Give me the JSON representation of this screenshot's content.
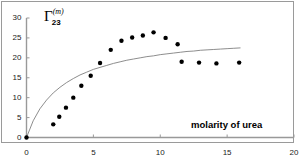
{
  "chart_data": {
    "type": "scatter",
    "title": "",
    "xlabel": "molarity of urea",
    "ylabel": "Γ·(m) 23",
    "ylabel_parts": {
      "symbol": "Γ",
      "superscript": "(m)",
      "subscript": "23"
    },
    "xlim": [
      0,
      20
    ],
    "ylim": [
      0,
      30
    ],
    "xticks": [
      0,
      5,
      10,
      15,
      20
    ],
    "yticks": [
      0,
      5,
      10,
      15,
      20,
      25,
      30
    ],
    "xtick_labels": [
      "0",
      "5",
      "10",
      "15",
      "20"
    ],
    "ytick_labels": [
      "0",
      "5",
      "10",
      "15",
      "20",
      "25",
      "30"
    ],
    "grid": false,
    "legend": null,
    "frame": true,
    "marker_color": "#000000",
    "curve_color": "#808080",
    "axis_color": "#999999",
    "series": [
      {
        "name": "data points",
        "style": "markers",
        "points": [
          [
            0.0,
            0.0
          ],
          [
            2.0,
            3.3
          ],
          [
            2.45,
            5.2
          ],
          [
            2.95,
            7.5
          ],
          [
            3.5,
            10.0
          ],
          [
            4.1,
            13.0
          ],
          [
            4.8,
            15.5
          ],
          [
            5.5,
            18.7
          ],
          [
            6.3,
            22.0
          ],
          [
            7.1,
            24.3
          ],
          [
            7.9,
            25.1
          ],
          [
            8.7,
            25.6
          ],
          [
            9.5,
            26.4
          ],
          [
            10.4,
            25.0
          ],
          [
            11.3,
            23.4
          ],
          [
            11.6,
            19.0
          ],
          [
            12.9,
            18.8
          ],
          [
            14.2,
            18.6
          ],
          [
            15.9,
            18.8
          ]
        ]
      },
      {
        "name": "fitted curve",
        "style": "line",
        "points": [
          [
            0.0,
            0.0
          ],
          [
            0.5,
            4.2
          ],
          [
            1.0,
            7.2
          ],
          [
            1.5,
            9.4
          ],
          [
            2.0,
            11.2
          ],
          [
            2.5,
            12.6
          ],
          [
            3.0,
            13.8
          ],
          [
            3.5,
            14.8
          ],
          [
            4.0,
            15.7
          ],
          [
            4.5,
            16.4
          ],
          [
            5.0,
            17.1
          ],
          [
            5.5,
            17.6
          ],
          [
            6.0,
            18.1
          ],
          [
            6.5,
            18.6
          ],
          [
            7.0,
            19.0
          ],
          [
            7.5,
            19.4
          ],
          [
            8.0,
            19.7
          ],
          [
            8.5,
            20.0
          ],
          [
            9.0,
            20.3
          ],
          [
            9.5,
            20.5
          ],
          [
            10.0,
            20.8
          ],
          [
            10.5,
            21.0
          ],
          [
            11.0,
            21.2
          ],
          [
            11.5,
            21.4
          ],
          [
            12.0,
            21.6
          ],
          [
            12.5,
            21.7
          ],
          [
            13.0,
            21.9
          ],
          [
            13.5,
            22.0
          ],
          [
            14.0,
            22.1
          ],
          [
            14.5,
            22.2
          ],
          [
            15.0,
            22.3
          ],
          [
            15.5,
            22.4
          ],
          [
            16.0,
            22.5
          ]
        ]
      }
    ]
  }
}
